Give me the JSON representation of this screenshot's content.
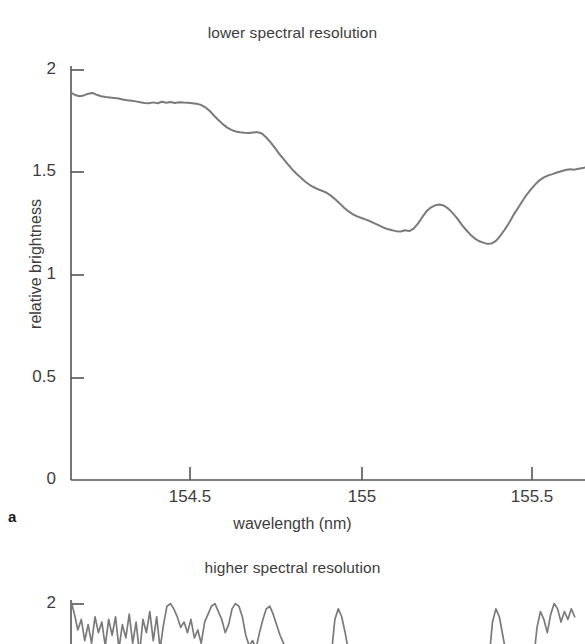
{
  "figure": {
    "axis_title_x": "wavelength (nm)",
    "axis_title_y": "relative brightness",
    "line_color": "#7a7a7a",
    "axis_color": "#555555",
    "text_color": "#3d3d3d",
    "background": "#ffffff"
  },
  "panel_a": {
    "label": "a",
    "title": "lower spectral resolution",
    "x_ticks": [
      "154.5",
      "155",
      "155.5"
    ],
    "y_ticks": [
      "2",
      "1.5",
      "1",
      "0.5",
      "0"
    ]
  },
  "panel_b": {
    "title": "higher spectral resolution",
    "y_ticks": [
      "2"
    ]
  },
  "chart_data": [
    {
      "type": "line",
      "title": "lower spectral resolution",
      "panel": "a",
      "xlabel": "wavelength (nm)",
      "ylabel": "relative brightness",
      "xlim": [
        154.153,
        155.653
      ],
      "ylim": [
        0,
        2
      ],
      "xticks": [
        154.5,
        155.0,
        155.5
      ],
      "yticks": [
        0,
        0.5,
        1,
        1.5,
        2
      ],
      "grid": false,
      "legend": null,
      "series": [
        {
          "name": "lower spectral resolution spectrum",
          "x": [
            154.153,
            154.165,
            154.178,
            154.19,
            154.203,
            154.216,
            154.228,
            154.241,
            154.254,
            154.266,
            154.279,
            154.292,
            154.304,
            154.317,
            154.33,
            154.342,
            154.355,
            154.368,
            154.38,
            154.393,
            154.406,
            154.418,
            154.431,
            154.444,
            154.456,
            154.469,
            154.482,
            154.494,
            154.507,
            154.52,
            154.532,
            154.545,
            154.558,
            154.57,
            154.583,
            154.596,
            154.608,
            154.621,
            154.634,
            154.646,
            154.659,
            154.672,
            154.684,
            154.697,
            154.71,
            154.722,
            154.735,
            154.748,
            154.76,
            154.773,
            154.786,
            154.798,
            154.811,
            154.824,
            154.836,
            154.849,
            154.862,
            154.874,
            154.887,
            154.9,
            154.912,
            154.925,
            154.938,
            154.95,
            154.963,
            154.976,
            154.988,
            155.001,
            155.014,
            155.026,
            155.039,
            155.052,
            155.064,
            155.077,
            155.09,
            155.102,
            155.115,
            155.128,
            155.14,
            155.153,
            155.166,
            155.178,
            155.191,
            155.204,
            155.216,
            155.229,
            155.242,
            155.254,
            155.267,
            155.28,
            155.292,
            155.305,
            155.318,
            155.33,
            155.343,
            155.356,
            155.368,
            155.381,
            155.394,
            155.406,
            155.419,
            155.432,
            155.444,
            155.457,
            155.47,
            155.482,
            155.495,
            155.508,
            155.52,
            155.533,
            155.546,
            155.558,
            155.571,
            155.584,
            155.596,
            155.609,
            155.622,
            155.634,
            155.647,
            155.653
          ],
          "y": [
            1.89,
            1.878,
            1.872,
            1.876,
            1.884,
            1.888,
            1.879,
            1.872,
            1.868,
            1.866,
            1.864,
            1.861,
            1.856,
            1.852,
            1.85,
            1.847,
            1.843,
            1.839,
            1.838,
            1.842,
            1.838,
            1.845,
            1.84,
            1.844,
            1.839,
            1.843,
            1.841,
            1.84,
            1.838,
            1.835,
            1.83,
            1.818,
            1.8,
            1.778,
            1.756,
            1.736,
            1.72,
            1.708,
            1.7,
            1.696,
            1.694,
            1.693,
            1.695,
            1.697,
            1.69,
            1.672,
            1.648,
            1.62,
            1.592,
            1.566,
            1.54,
            1.516,
            1.494,
            1.474,
            1.456,
            1.44,
            1.428,
            1.418,
            1.41,
            1.4,
            1.386,
            1.368,
            1.348,
            1.328,
            1.31,
            1.296,
            1.286,
            1.278,
            1.27,
            1.262,
            1.252,
            1.242,
            1.232,
            1.224,
            1.218,
            1.214,
            1.212,
            1.218,
            1.214,
            1.226,
            1.252,
            1.282,
            1.312,
            1.33,
            1.34,
            1.344,
            1.338,
            1.324,
            1.302,
            1.276,
            1.248,
            1.222,
            1.198,
            1.18,
            1.166,
            1.158,
            1.152,
            1.154,
            1.168,
            1.192,
            1.222,
            1.256,
            1.292,
            1.326,
            1.36,
            1.39,
            1.418,
            1.442,
            1.462,
            1.476,
            1.486,
            1.492,
            1.5,
            1.506,
            1.512,
            1.516,
            1.514,
            1.518,
            1.522,
            1.524
          ]
        }
      ],
      "annotations": {
        "plateau_left": 1.84,
        "shoulder": 1.69,
        "local_min_1": 1.21,
        "local_peak": 1.34,
        "deep_min": 1.15,
        "shelf_right": 1.54,
        "plateau_right": 1.79
      }
    },
    {
      "type": "line",
      "title": "higher spectral resolution",
      "panel": "b",
      "note": "panel cropped at bottom edge of image; only region near relative brightness 2 visible",
      "xlim": [
        154.153,
        155.653
      ],
      "ylim": [
        1.55,
        2.08
      ],
      "yticks": [
        2
      ],
      "grid": false,
      "series": [
        {
          "name": "higher spectral resolution spectrum",
          "x": [
            154.153,
            154.163,
            154.173,
            154.183,
            154.193,
            154.203,
            154.213,
            154.223,
            154.233,
            154.243,
            154.253,
            154.263,
            154.273,
            154.283,
            154.293,
            154.303,
            154.313,
            154.323,
            154.333,
            154.343,
            154.353,
            154.363,
            154.373,
            154.383,
            154.393,
            154.403,
            154.413,
            154.423,
            154.433,
            154.443,
            154.453,
            154.463,
            154.473,
            154.483,
            154.493,
            154.503,
            154.513,
            154.523,
            154.533,
            154.543,
            154.553,
            154.563,
            154.573,
            154.583,
            154.593,
            154.603,
            154.613,
            154.623,
            154.633,
            154.643,
            154.653,
            154.663,
            154.673,
            154.683,
            154.693,
            154.703,
            154.713,
            154.723,
            154.733,
            154.743,
            154.753,
            154.763,
            154.773,
            154.783,
            154.793,
            154.803,
            154.813,
            154.823,
            154.833,
            154.843,
            154.853,
            154.863,
            154.873,
            154.883,
            154.893,
            154.903,
            154.913,
            154.923,
            154.933,
            154.943,
            154.953,
            154.963,
            154.973,
            154.983,
            154.993,
            155.003,
            155.013,
            155.023,
            155.033,
            155.043,
            155.053,
            155.063,
            155.073,
            155.083,
            155.093,
            155.103,
            155.113,
            155.123,
            155.133,
            155.143,
            155.153,
            155.163,
            155.173,
            155.183,
            155.193,
            155.203,
            155.213,
            155.223,
            155.233,
            155.243,
            155.253,
            155.263,
            155.273,
            155.283,
            155.293,
            155.303,
            155.313,
            155.323,
            155.333,
            155.343,
            155.353,
            155.363,
            155.373,
            155.383,
            155.393,
            155.403,
            155.413,
            155.423,
            155.433,
            155.443,
            155.453,
            155.463,
            155.473,
            155.483,
            155.493,
            155.503,
            155.513,
            155.523,
            155.533,
            155.543,
            155.553,
            155.563,
            155.573,
            155.583,
            155.593,
            155.603,
            155.613,
            155.623,
            155.633,
            155.643,
            155.653
          ],
          "y": [
            2.02,
            1.92,
            1.8,
            1.88,
            1.72,
            1.84,
            1.7,
            1.9,
            1.78,
            1.86,
            1.68,
            1.88,
            1.76,
            1.9,
            1.66,
            1.84,
            1.74,
            1.92,
            1.7,
            1.86,
            1.62,
            1.88,
            1.78,
            1.94,
            1.72,
            1.9,
            1.66,
            1.84,
            1.98,
            2.0,
            1.96,
            1.9,
            1.82,
            1.86,
            1.78,
            1.88,
            1.74,
            1.8,
            1.7,
            1.86,
            1.92,
            1.98,
            2.0,
            1.94,
            1.88,
            1.78,
            1.84,
            1.96,
            2.0,
            1.98,
            1.9,
            1.76,
            1.68,
            1.72,
            1.66,
            1.78,
            1.88,
            1.96,
            1.98,
            1.92,
            1.84,
            1.76,
            1.7,
            1.66,
            1.62,
            1.68,
            1.6,
            1.64,
            1.58,
            1.62,
            1.6,
            1.58,
            1.62,
            1.66,
            1.6,
            1.58,
            1.62,
            1.88,
            1.96,
            1.9,
            1.78,
            1.64,
            1.6,
            1.58,
            1.62,
            1.59,
            1.58,
            1.6,
            1.58,
            1.59,
            1.58,
            1.6,
            1.58,
            1.59,
            1.58,
            1.6,
            1.58,
            1.59,
            1.58,
            1.58,
            1.59,
            1.58,
            1.58,
            1.6,
            1.58,
            1.59,
            1.58,
            1.58,
            1.59,
            1.58,
            1.6,
            1.58,
            1.59,
            1.58,
            1.58,
            1.6,
            1.58,
            1.62,
            1.58,
            1.6,
            1.58,
            1.59,
            1.58,
            1.86,
            1.96,
            1.9,
            1.76,
            1.62,
            1.58,
            1.6,
            1.58,
            1.59,
            1.58,
            1.6,
            1.62,
            1.58,
            1.82,
            1.94,
            1.88,
            1.78,
            1.92,
            2.0,
            1.96,
            1.86,
            1.94,
            1.88,
            1.96,
            1.9
          ]
        }
      ]
    }
  ]
}
